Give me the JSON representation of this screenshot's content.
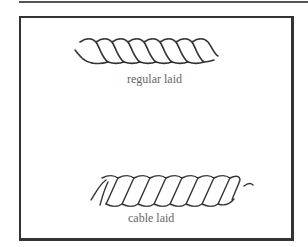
{
  "figure": {
    "items": [
      {
        "label": "regular laid",
        "type": "rope-illustration"
      },
      {
        "label": "cable laid",
        "type": "rope-illustration"
      }
    ],
    "colors": {
      "line": "#333333",
      "label": "#666666",
      "frame": "#333333"
    }
  }
}
